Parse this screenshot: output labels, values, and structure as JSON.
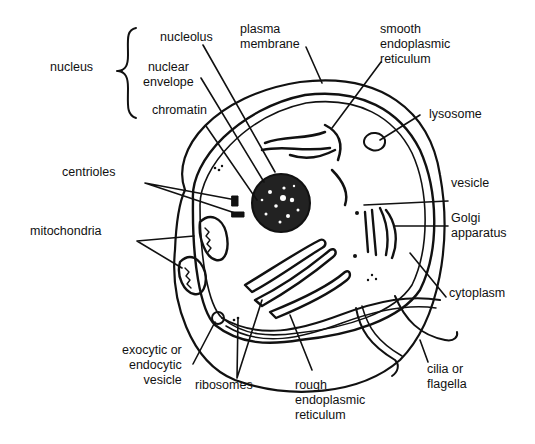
{
  "diagram": {
    "background": "#ffffff",
    "ink": "#111111",
    "labels": {
      "nucleus": "nucleus",
      "nucleolus": "nucleolus",
      "nuclear_envelope": "nuclear\nenvelope",
      "chromatin": "chromatin",
      "plasma_membrane": "plasma\nmembrane",
      "smooth_er": "smooth\nendoplasmic\nreticulum",
      "lysosome": "lysosome",
      "centrioles": "centrioles",
      "mitochondria": "mitochondria",
      "vesicle": "vesicle",
      "golgi": "Golgi\napparatus",
      "cytoplasm": "cytoplasm",
      "exo_endo_vesicle": "exocytic or\nendocytic\nvesicle",
      "ribosomes": "ribosomes",
      "rough_er": "rough\nendoplasmic\nreticulum",
      "cilia": "cilia or\nflagella"
    }
  }
}
